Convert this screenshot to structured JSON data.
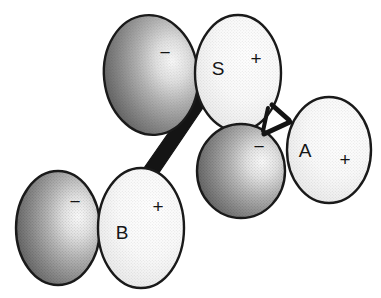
{
  "figure": {
    "width": 381,
    "height": 298,
    "background_color": "#ffffff",
    "outline_color": "#1a1a1a",
    "bond_color": "#141414"
  },
  "legend": {
    "negative_sign": "−",
    "positive_sign": "+"
  },
  "spheres": [
    {
      "id": "s-negative",
      "name": "S negative lobe",
      "shade": "dark",
      "label": "",
      "charge": "−",
      "cx": 151,
      "cy": 75,
      "rx": 47,
      "ry": 60,
      "rotation": -6,
      "label_x": 151,
      "label_y": 75,
      "charge_x": 165,
      "charge_y": 54,
      "fill_light": "#f2f2f2",
      "fill_dark": "#6f6f6f"
    },
    {
      "id": "s-positive",
      "name": "S positive lobe",
      "shade": "light",
      "label": "S",
      "charge": "+",
      "cx": 238,
      "cy": 73,
      "rx": 43,
      "ry": 58,
      "rotation": 0,
      "label_x": 218,
      "label_y": 70,
      "charge_x": 256,
      "charge_y": 60,
      "fill_light": "#ffffff",
      "fill_dark": "#d6d6d6"
    },
    {
      "id": "a-negative",
      "name": "A negative lobe",
      "shade": "dark",
      "label": "",
      "charge": "−",
      "cx": 241,
      "cy": 171,
      "rx": 44,
      "ry": 47,
      "rotation": 0,
      "label_x": 241,
      "label_y": 171,
      "charge_x": 259,
      "charge_y": 148,
      "fill_light": "#f0f0f0",
      "fill_dark": "#6b6b6b"
    },
    {
      "id": "a-positive",
      "name": "A positive lobe",
      "shade": "light",
      "label": "A",
      "charge": "+",
      "cx": 329,
      "cy": 150,
      "rx": 42,
      "ry": 53,
      "rotation": 0,
      "label_x": 305,
      "label_y": 152,
      "charge_x": 345,
      "charge_y": 161,
      "fill_light": "#ffffff",
      "fill_dark": "#d8d8d8"
    },
    {
      "id": "b-negative",
      "name": "B negative lobe",
      "shade": "dark",
      "label": "",
      "charge": "−",
      "cx": 58,
      "cy": 228,
      "rx": 42,
      "ry": 57,
      "rotation": 0,
      "label_x": 58,
      "label_y": 228,
      "charge_x": 75,
      "charge_y": 203,
      "fill_light": "#f2f2f2",
      "fill_dark": "#6d6d6d"
    },
    {
      "id": "b-positive",
      "name": "B positive lobe",
      "shade": "light",
      "label": "B",
      "charge": "+",
      "cx": 141,
      "cy": 228,
      "rx": 43,
      "ry": 60,
      "rotation": 0,
      "label_x": 122,
      "label_y": 234,
      "charge_x": 158,
      "charge_y": 208,
      "fill_light": "#ffffff",
      "fill_dark": "#d8d8d8"
    }
  ],
  "bonds": [
    {
      "id": "bond-s-b",
      "name": "S to B wedge bond",
      "style": "wedge",
      "points": "204,82 213,93 154,180 144,168",
      "color": "#141414"
    },
    {
      "id": "bond-s-a-upper",
      "name": "S to A upper bond",
      "style": "line",
      "x1": 272,
      "y1": 105,
      "x2": 289,
      "y2": 120,
      "width": 5,
      "color": "#141414"
    },
    {
      "id": "bond-s-a-lower",
      "name": "S to A lower bond",
      "style": "line",
      "x1": 264,
      "y1": 134,
      "x2": 290,
      "y2": 122,
      "width": 5,
      "color": "#141414"
    },
    {
      "id": "bond-s-a-stub",
      "name": "S sphere lower stub",
      "style": "line",
      "x1": 268,
      "y1": 108,
      "x2": 263,
      "y2": 131,
      "width": 4,
      "color": "#141414"
    }
  ]
}
